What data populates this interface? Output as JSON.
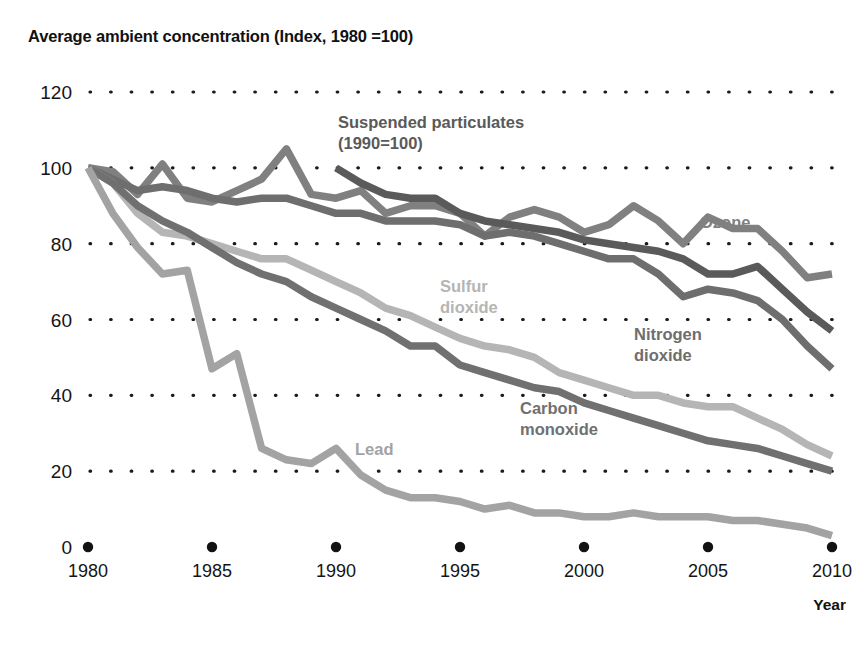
{
  "chart_data": {
    "type": "line",
    "title": "Average ambient concentration (Index, 1980 =100)",
    "xlabel": "Year",
    "ylabel": "",
    "xlim": [
      1980,
      2010
    ],
    "ylim": [
      0,
      120
    ],
    "yticks": [
      "0",
      "20",
      "40",
      "60",
      "80",
      "100",
      "120"
    ],
    "ytick_values": [
      0,
      20,
      40,
      60,
      80,
      100,
      120
    ],
    "xticks": [
      "1980",
      "1985",
      "1990",
      "1995",
      "2000",
      "2005",
      "2010"
    ],
    "xtick_values": [
      1980,
      1985,
      1990,
      1995,
      2000,
      2005,
      2010
    ],
    "grid": "horizontal-dotted",
    "legend_position": "inline-annotations",
    "x": [
      1980,
      1981,
      1982,
      1983,
      1984,
      1985,
      1986,
      1987,
      1988,
      1989,
      1990,
      1991,
      1992,
      1993,
      1994,
      1995,
      1996,
      1997,
      1998,
      1999,
      2000,
      2001,
      2002,
      2003,
      2004,
      2005,
      2006,
      2007,
      2008,
      2009,
      2010
    ],
    "series": [
      {
        "name": "Ozone",
        "label": "Ozone",
        "color": "#808080",
        "label_x": 700,
        "label_y": 228,
        "values": [
          100,
          99,
          93,
          101,
          92,
          91,
          94,
          97,
          105,
          93,
          92,
          94,
          88,
          90,
          90,
          88,
          82,
          87,
          89,
          87,
          83,
          85,
          90,
          86,
          80,
          87,
          84,
          84,
          78,
          71,
          72
        ]
      },
      {
        "name": "Suspended particulates",
        "label": "Suspended particulates\n(1990=100)",
        "label_line1": "Suspended particulates",
        "label_line2": "(1990=100)",
        "color": "#5a5a5a",
        "label_x": 338,
        "label_y": 128,
        "note": "(1990=100)",
        "start_year": 1990,
        "values": [
          null,
          null,
          null,
          null,
          null,
          null,
          null,
          null,
          null,
          null,
          100,
          96,
          93,
          92,
          92,
          88,
          86,
          85,
          84,
          83,
          81,
          80,
          79,
          78,
          76,
          72,
          72,
          74,
          68,
          62,
          57
        ]
      },
      {
        "name": "Nitrogen dioxide",
        "label": "Nitrogen dioxide",
        "label_line1": "Nitrogen",
        "label_line2": "dioxide",
        "color": "#6e6e6e",
        "label_x": 634,
        "label_y": 340,
        "values": [
          100,
          97,
          94,
          95,
          94,
          92,
          91,
          92,
          92,
          90,
          88,
          88,
          86,
          86,
          86,
          85,
          82,
          83,
          82,
          80,
          78,
          76,
          76,
          72,
          66,
          68,
          67,
          65,
          60,
          53,
          47
        ]
      },
      {
        "name": "Sulfur dioxide",
        "label": "Sulfur dioxide",
        "label_line1": "Sulfur",
        "label_line2": "dioxide",
        "color": "#b5b5b5",
        "label_x": 440,
        "label_y": 292,
        "values": [
          100,
          96,
          88,
          83,
          82,
          80,
          78,
          76,
          76,
          73,
          70,
          67,
          63,
          61,
          58,
          55,
          53,
          52,
          50,
          46,
          44,
          42,
          40,
          40,
          38,
          37,
          37,
          34,
          31,
          27,
          24
        ]
      },
      {
        "name": "Carbon monoxide",
        "label": "Carbon monoxide",
        "label_line1": "Carbon",
        "label_line2": "monoxide",
        "color": "#707070",
        "label_x": 520,
        "label_y": 414,
        "values": [
          100,
          96,
          90,
          86,
          83,
          79,
          75,
          72,
          70,
          66,
          63,
          60,
          57,
          53,
          53,
          48,
          46,
          44,
          42,
          41,
          38,
          36,
          34,
          32,
          30,
          28,
          27,
          26,
          24,
          22,
          20
        ]
      },
      {
        "name": "Lead",
        "label": "Lead",
        "color": "#a3a3a3",
        "label_x": 355,
        "label_y": 455,
        "values": [
          100,
          88,
          79,
          72,
          73,
          47,
          51,
          26,
          23,
          22,
          26,
          19,
          15,
          13,
          13,
          12,
          10,
          11,
          9,
          9,
          8,
          8,
          9,
          8,
          8,
          8,
          7,
          7,
          6,
          5,
          3
        ]
      }
    ]
  },
  "axis": {
    "year_label": "Year"
  }
}
